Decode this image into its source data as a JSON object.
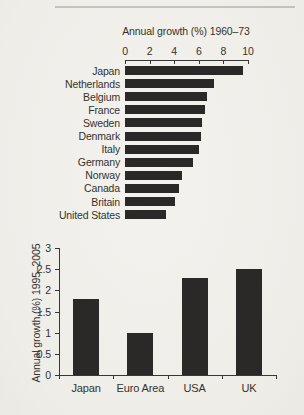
{
  "figure": {
    "background": "#f0efeb",
    "bar_color": "#2b2927",
    "axis_color": "#3a3733",
    "text_color": "#35322e"
  },
  "chart_data": [
    {
      "type": "bar",
      "orientation": "horizontal",
      "title": "Annual growth (%) 1960–73",
      "categories": [
        "Japan",
        "Netherlands",
        "Belgium",
        "France",
        "Sweden",
        "Denmark",
        "Italy",
        "Germany",
        "Norway",
        "Canada",
        "Britain",
        "United States"
      ],
      "values": [
        9.6,
        7.2,
        6.7,
        6.5,
        6.3,
        6.2,
        6.0,
        5.5,
        4.6,
        4.4,
        4.1,
        3.3
      ],
      "xlabel": "Annual growth (%) 1960–73",
      "xlim": [
        0,
        10
      ],
      "xticks": [
        0,
        2,
        4,
        6,
        8,
        10
      ],
      "axis_position": "top",
      "grid": false,
      "legend": false
    },
    {
      "type": "bar",
      "orientation": "vertical",
      "title": "",
      "categories": [
        "Japan",
        "Euro Area",
        "USA",
        "UK"
      ],
      "values": [
        1.8,
        1.0,
        2.3,
        2.5
      ],
      "ylabel": "Annual growth (%) 1995–2005",
      "ylim": [
        0,
        3
      ],
      "yticks": [
        0,
        0.5,
        1,
        1.5,
        2,
        2.5,
        3
      ],
      "grid": false,
      "legend": false
    }
  ]
}
